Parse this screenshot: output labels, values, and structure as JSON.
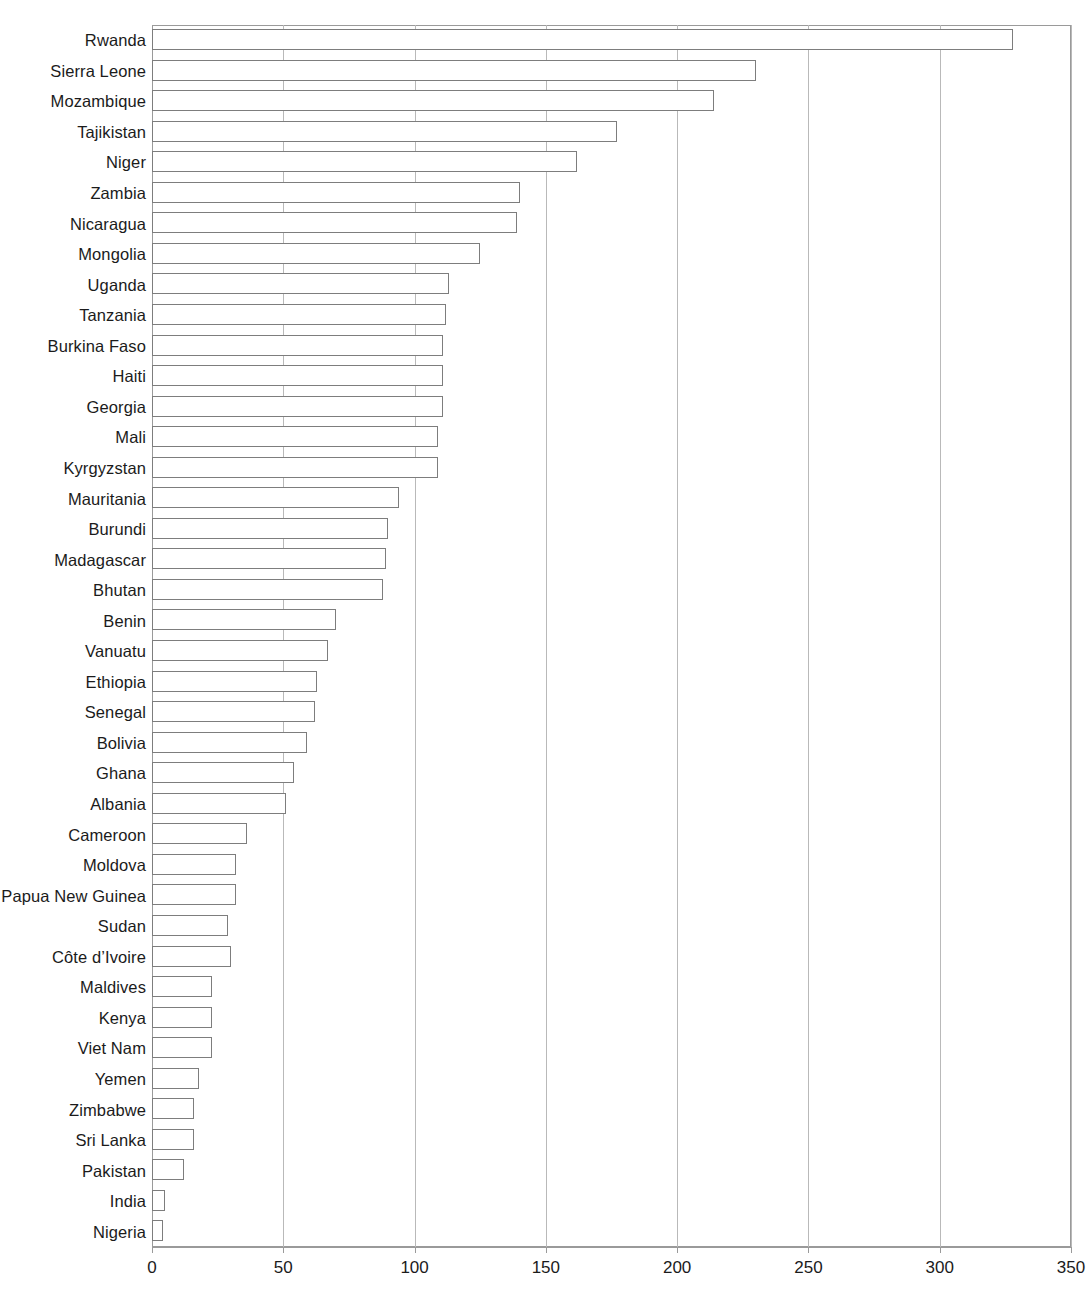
{
  "chart_data": {
    "type": "bar",
    "orientation": "horizontal",
    "title": "",
    "subtitle": "",
    "xlabel": "",
    "ylabel": "",
    "xlim": [
      0,
      350
    ],
    "ylim": null,
    "grid": "vertical",
    "legend": null,
    "legend_position": "none",
    "xticks": [
      0,
      50,
      100,
      150,
      200,
      250,
      300,
      350
    ],
    "xtick_labels": [
      "0",
      "50",
      "100",
      "150",
      "200",
      "250",
      "300",
      "350"
    ],
    "categories": [
      "Rwanda",
      "Sierra Leone",
      "Mozambique",
      "Tajikistan",
      "Niger",
      "Zambia",
      "Nicaragua",
      "Mongolia",
      "Uganda",
      "Tanzania",
      "Burkina Faso",
      "Haiti",
      "Georgia",
      "Mali",
      "Kyrgyzstan",
      "Mauritania",
      "Burundi",
      "Madagascar",
      "Bhutan",
      "Benin",
      "Vanuatu",
      "Ethiopia",
      "Senegal",
      "Bolivia",
      "Ghana",
      "Albania",
      "Cameroon",
      "Moldova",
      "Papua New Guinea",
      "Sudan",
      "Côte d’Ivoire",
      "Maldives",
      "Kenya",
      "Viet Nam",
      "Yemen",
      "Zimbabwe",
      "Sri Lanka",
      "Pakistan",
      "India",
      "Nigeria"
    ],
    "values": [
      328,
      230,
      214,
      177,
      162,
      140,
      139,
      125,
      113,
      112,
      111,
      111,
      111,
      109,
      109,
      94,
      90,
      89,
      88,
      70,
      67,
      63,
      62,
      59,
      54,
      51,
      36,
      32,
      32,
      29,
      30,
      23,
      23,
      23,
      18,
      16,
      16,
      12,
      5,
      4
    ],
    "colors": {
      "bar_fill": "#ffffff",
      "bar_stroke": "#7d7d7d",
      "gridline": "#b9b9b9",
      "axis": "#9a9a9a",
      "text": "#1b1b1b",
      "background": "#ffffff"
    }
  }
}
